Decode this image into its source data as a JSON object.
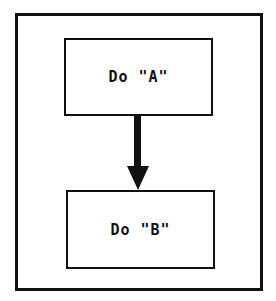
{
  "diagram": {
    "type": "flowchart",
    "nodes": [
      {
        "id": "A",
        "label": "Do \"A\""
      },
      {
        "id": "B",
        "label": "Do \"B\""
      }
    ],
    "edges": [
      {
        "from": "A",
        "to": "B"
      }
    ],
    "colors": {
      "stroke": "#111111",
      "background": "#ffffff"
    }
  }
}
